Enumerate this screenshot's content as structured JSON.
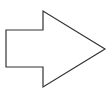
{
  "diagram": {
    "shape": "block-arrow-right",
    "label": "Right arrow",
    "stroke_color": "#333333",
    "fill_color": "#ffffff",
    "stroke_width": 1.2,
    "points": "6,30 43,30 43,11 105,49 43,87 43,67 6,67"
  }
}
